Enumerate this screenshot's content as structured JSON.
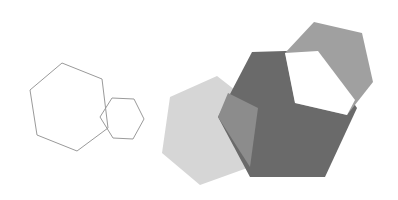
{
  "diagram": {
    "background": "#ffffff",
    "shapes": [
      {
        "name": "outline-hexagon-large",
        "points": "62,63 102,79 108,128 77,151 37,135 30,90",
        "fill": "none",
        "stroke": "#9a9a9a"
      },
      {
        "name": "outline-hexagon-small",
        "points": "112,98 134,99 144,119 133,139 113,138 100,117",
        "fill": "none",
        "stroke": "#9a9a9a"
      },
      {
        "name": "light-hexagon",
        "points": "217,76 258,108 250,167 200,185 162,153 170,97",
        "fill": "#d6d6d6",
        "stroke": "none"
      },
      {
        "name": "dark-hexagon",
        "points": "252,52 318,50 357,108 325,177 250,177 218,117",
        "fill": "#6a6a6a",
        "stroke": "none"
      },
      {
        "name": "overlap-region",
        "points": "228,93 258,108 250,167 218,117",
        "fill": "#8c8c8c",
        "stroke": "none"
      },
      {
        "name": "top-hexagon",
        "points": "314,22 362,33 373,82 347,115 295,103 285,53",
        "fill": "#a0a0a0",
        "stroke": "none"
      },
      {
        "name": "white-cutout",
        "points": "285,53 318,51 355,100 347,115 295,103",
        "fill": "#ffffff",
        "stroke": "none"
      }
    ]
  }
}
